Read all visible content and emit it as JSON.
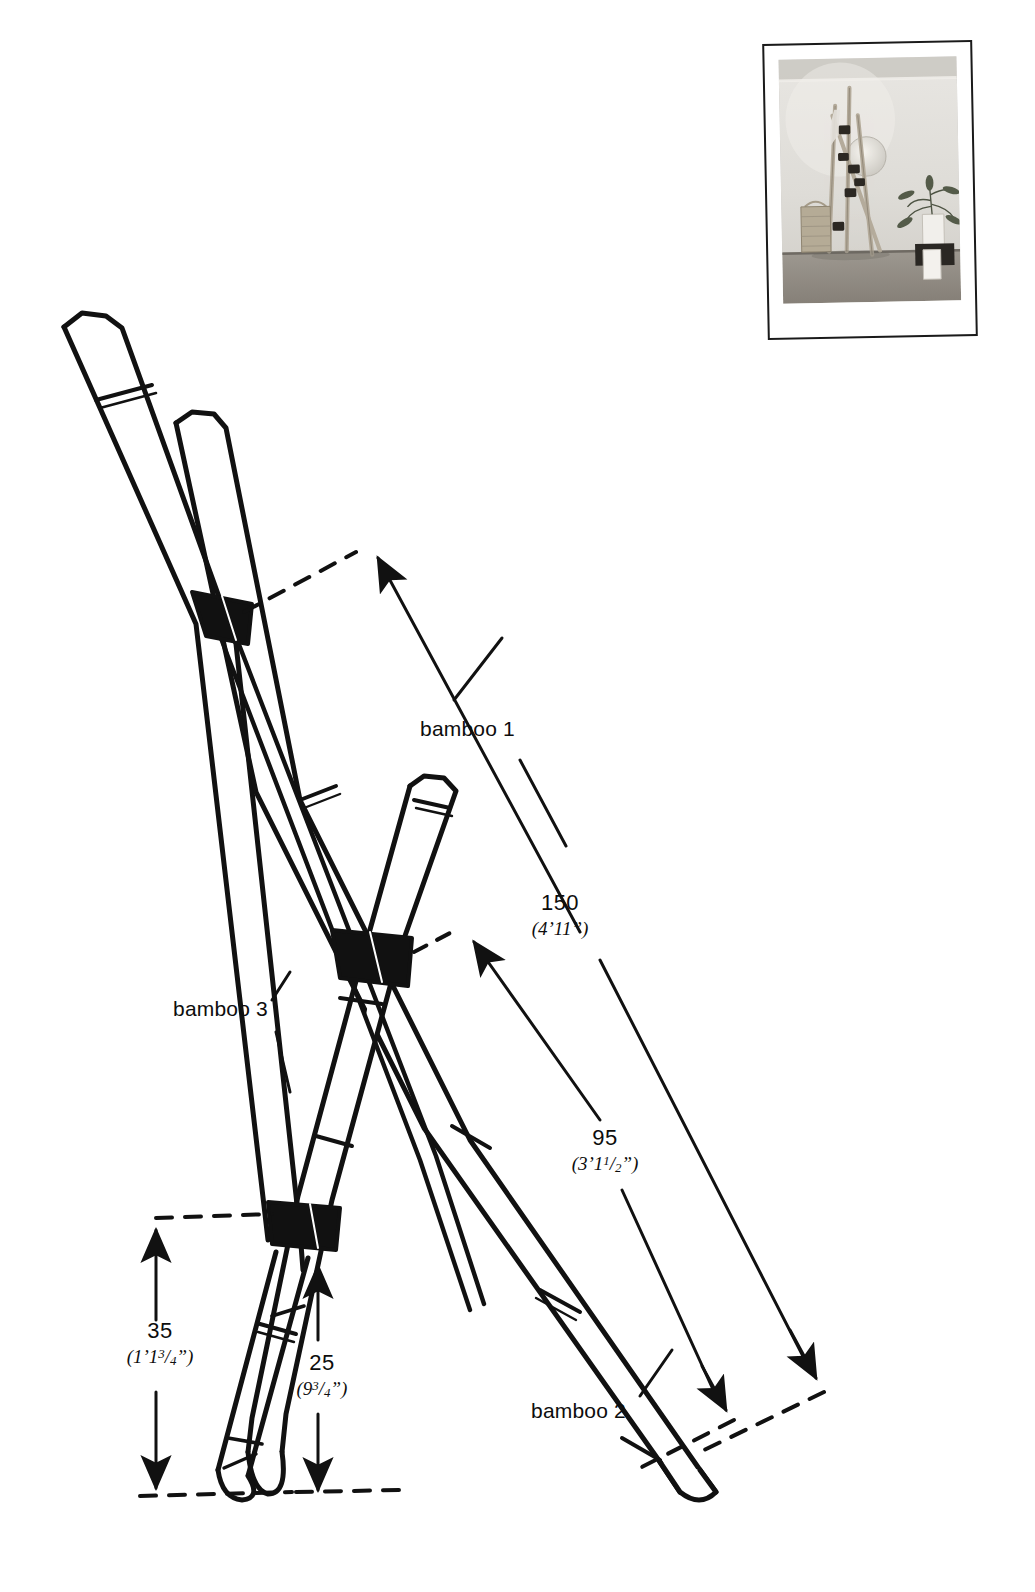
{
  "page": {
    "background_color": "#ffffff",
    "ink_color": "#111111"
  },
  "photo": {
    "caption": "",
    "alt": "Photograph of the finished bamboo A-frame rack leaning against a wall with a woven basket and a potted plant",
    "border_color": "#1a1a1a"
  },
  "part_labels": [
    {
      "id": "bamboo-1",
      "text": "bamboo 1"
    },
    {
      "id": "bamboo-2",
      "text": "bamboo 2"
    },
    {
      "id": "bamboo-3",
      "text": "bamboo 3"
    }
  ],
  "dimensions": [
    {
      "id": "dim-150",
      "metric": "150",
      "imperial_whole": "4’11",
      "imperial_feet": "4’",
      "imperial_inches": "11",
      "imperial_frac_num": "",
      "imperial_frac_den": "",
      "imperial_text": "(4’11”)"
    },
    {
      "id": "dim-95",
      "metric": "95",
      "imperial_feet": "3’",
      "imperial_inches": "1",
      "imperial_frac_num": "1",
      "imperial_frac_den": "2",
      "imperial_text": "(3’1½”)"
    },
    {
      "id": "dim-35",
      "metric": "35",
      "imperial_feet": "1’",
      "imperial_inches": "1",
      "imperial_frac_num": "3",
      "imperial_frac_den": "4",
      "imperial_text": "(1’1¾”)"
    },
    {
      "id": "dim-25",
      "metric": "25",
      "imperial_feet": "",
      "imperial_inches": "9",
      "imperial_frac_num": "3",
      "imperial_frac_den": "4",
      "imperial_text": "(9¾”)"
    }
  ],
  "drawing": {
    "type": "line-diagram",
    "description": "Three bamboo poles lashed into an A-frame ladder; black lashings at three crossing points; dimension arrows with dashed extension lines",
    "lashings": 3,
    "poles": 3
  }
}
